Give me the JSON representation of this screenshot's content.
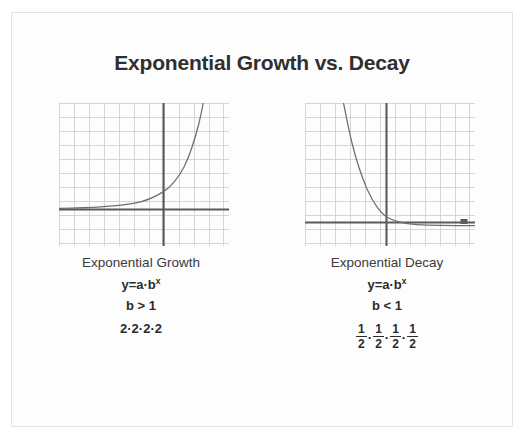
{
  "slide": {
    "title": "Exponential Growth vs. Decay",
    "background_color": "#ffffff",
    "card_color": "#fdfdfd",
    "card_border_color": "#e3e3e3",
    "text_color": "#2f2f2f"
  },
  "panels": [
    {
      "id": "growth",
      "caption": "Exponential Growth",
      "formula_base": "y=a·b",
      "formula_exponent": "x",
      "condition": "b > 1",
      "expansion_text": "2·2·2·2",
      "expansion_kind": "plain"
    },
    {
      "id": "decay",
      "caption": "Exponential Decay",
      "formula_base": "y=a·b",
      "formula_exponent": "x",
      "condition": "b < 1",
      "expansion_text": "1/2·1/2·1/2·1/2",
      "expansion_kind": "fractions",
      "fractions": [
        {
          "num": "1",
          "den": "2"
        },
        {
          "num": "1",
          "den": "2"
        },
        {
          "num": "1",
          "den": "2"
        },
        {
          "num": "1",
          "den": "2"
        }
      ],
      "fraction_separator": "·"
    }
  ],
  "chart_data": [
    {
      "type": "line",
      "id": "exponential-growth-graph",
      "title": "Exponential Growth",
      "function": "y = a·b^x with b > 1",
      "xlabel": "",
      "ylabel": "",
      "grid": true,
      "grid_color": "#c9ccd4",
      "grid_spacing_units": 1,
      "axis_color": "#5a5a5a",
      "curve_color": "#6e6e6e",
      "xlim": [
        -6,
        5
      ],
      "ylim": [
        -3,
        7
      ],
      "x_axis_y": 0,
      "y_axis_x": 0,
      "x": [
        -6,
        -5,
        -4,
        -3,
        -2,
        -1,
        0,
        1,
        2,
        3,
        3.4
      ],
      "y": [
        0.02,
        0.03,
        0.06,
        0.12,
        0.25,
        0.5,
        1,
        2,
        4,
        8,
        10.5
      ],
      "annotations": []
    },
    {
      "type": "line",
      "id": "exponential-decay-graph",
      "title": "Exponential Decay",
      "function": "y = a·b^x with b < 1",
      "xlabel": "",
      "ylabel": "",
      "grid": true,
      "grid_color": "#c9ccd4",
      "grid_spacing_units": 1,
      "axis_color": "#5a5a5a",
      "curve_color": "#6e6e6e",
      "xlim": [
        -5,
        6
      ],
      "ylim": [
        -3,
        7
      ],
      "x_axis_y": 0,
      "y_axis_x": 0,
      "x": [
        -3.4,
        -3,
        -2,
        -1,
        0,
        1,
        2,
        3,
        4,
        5,
        6
      ],
      "y": [
        10.5,
        8,
        4,
        2,
        1,
        0.5,
        0.25,
        0.12,
        0.06,
        0.03,
        0.02
      ],
      "annotations": [
        {
          "kind": "arrowhead",
          "x": 5.3,
          "y": 0,
          "label": "x-axis-arrow"
        }
      ]
    }
  ]
}
